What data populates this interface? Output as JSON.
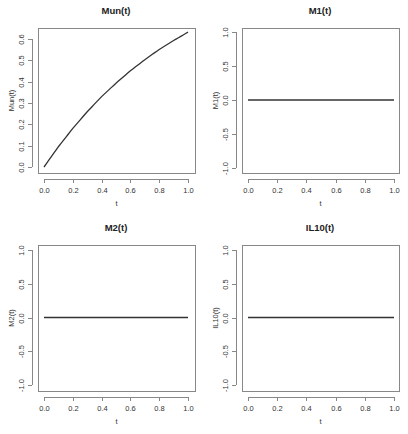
{
  "chart_data": [
    {
      "type": "line",
      "title": "Mun(t)",
      "xlabel": "t",
      "ylabel": "Mun(t)",
      "xlim": [
        0,
        1
      ],
      "ylim": [
        0,
        0.632
      ],
      "xticks": [
        "0.0",
        "0.2",
        "0.4",
        "0.6",
        "0.8",
        "1.0"
      ],
      "yticks": [
        "0.0",
        "0.1",
        "0.2",
        "0.3",
        "0.4",
        "0.5",
        "0.6"
      ],
      "grid": false,
      "legend": null,
      "x": [
        0.0,
        0.1,
        0.2,
        0.3,
        0.4,
        0.5,
        0.6,
        0.7,
        0.8,
        0.9,
        1.0
      ],
      "values": [
        0.0,
        0.095,
        0.181,
        0.259,
        0.33,
        0.393,
        0.451,
        0.503,
        0.551,
        0.593,
        0.632
      ]
    },
    {
      "type": "line",
      "title": "M1(t)",
      "xlabel": "t",
      "ylabel": "M1(t)",
      "xlim": [
        0,
        1
      ],
      "ylim": [
        -1,
        1
      ],
      "xticks": [
        "0.0",
        "0.2",
        "0.4",
        "0.6",
        "0.8",
        "1.0"
      ],
      "yticks": [
        "-1.0",
        "-0.5",
        "0.0",
        "0.5",
        "1.0"
      ],
      "grid": false,
      "legend": null,
      "x": [
        0.0,
        1.0
      ],
      "values": [
        0.0,
        0.0
      ]
    },
    {
      "type": "line",
      "title": "M2(t)",
      "xlabel": "t",
      "ylabel": "M2(t)",
      "xlim": [
        0,
        1
      ],
      "ylim": [
        -1,
        1
      ],
      "xticks": [
        "0.0",
        "0.2",
        "0.4",
        "0.6",
        "0.8",
        "1.0"
      ],
      "yticks": [
        "-1.0",
        "-0.5",
        "0.0",
        "0.5",
        "1.0"
      ],
      "grid": false,
      "legend": null,
      "x": [
        0.0,
        1.0
      ],
      "values": [
        0.0,
        0.0
      ]
    },
    {
      "type": "line",
      "title": "IL10(t)",
      "xlabel": "t",
      "ylabel": "IL10(t)",
      "xlim": [
        0,
        1
      ],
      "ylim": [
        -1,
        1
      ],
      "xticks": [
        "0.0",
        "0.2",
        "0.4",
        "0.6",
        "0.8",
        "1.0"
      ],
      "yticks": [
        "-1.0",
        "-0.5",
        "0.0",
        "0.5",
        "1.0"
      ],
      "grid": false,
      "legend": null,
      "x": [
        0.0,
        1.0
      ],
      "values": [
        0.0,
        0.0
      ]
    }
  ],
  "colors": {
    "line": "#333333",
    "axis": "#888888",
    "background": "#ffffff"
  }
}
